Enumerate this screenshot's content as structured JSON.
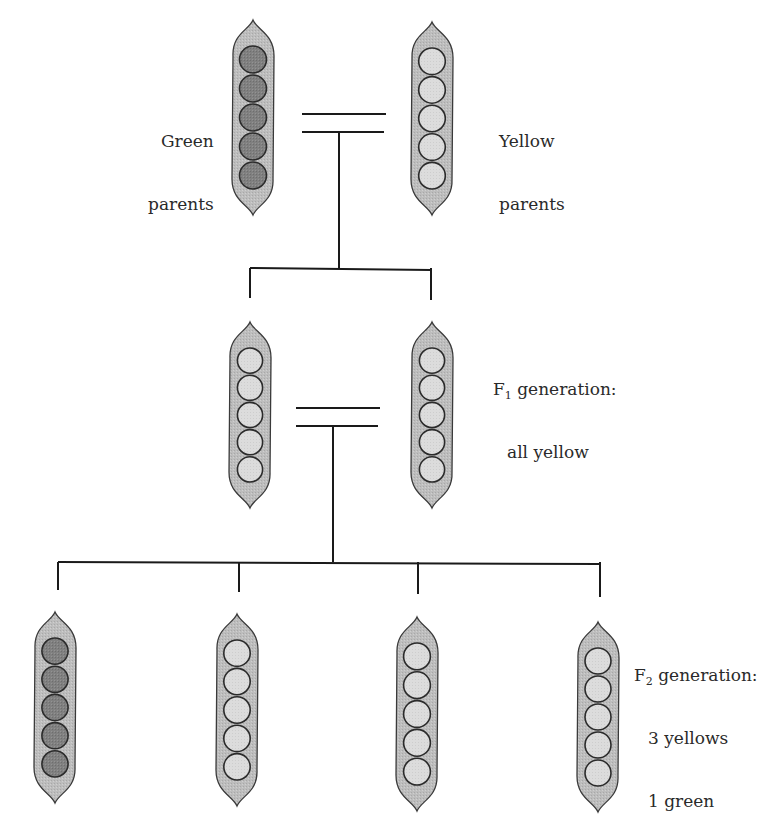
{
  "colors": {
    "background": "#ffffff",
    "line": "#1a1a1a",
    "pod_fill": "#bdbdbd",
    "pod_outline": "#3a3a3a",
    "pea_green": "#808080",
    "pea_yellow": "#dcdcdc",
    "pea_outline": "#2b2b2b",
    "text": "#2a2a2a"
  },
  "labels": {
    "green_parents": {
      "line1": "Green",
      "line2": "parents",
      "x": 148,
      "y": 89
    },
    "yellow_parents": {
      "line1": "Yellow",
      "line2": "parents",
      "x": 499,
      "y": 89
    },
    "f1": {
      "prefix": "F",
      "sub": "1",
      "line1_rest": " generation:",
      "line2": "all yellow",
      "x": 493,
      "y": 337
    },
    "f2": {
      "prefix": "F",
      "sub": "2",
      "line1_rest": " generation:",
      "line2": "3 yellows",
      "line3": "1 green",
      "x": 634,
      "y": 623
    }
  },
  "generations": [
    {
      "name": "parents",
      "pods": [
        {
          "id": "green-parent",
          "cx": 253,
          "top": 20,
          "bottom": 215,
          "pea": "green"
        },
        {
          "id": "yellow-parent",
          "cx": 432,
          "top": 22,
          "bottom": 215,
          "pea": "yellow"
        }
      ],
      "cross": {
        "x1": 302,
        "x2": 386,
        "y_top": 114,
        "y_bottom": 132
      }
    },
    {
      "name": "F1 generation",
      "pods": [
        {
          "id": "f1-pod-1",
          "cx": 250,
          "top": 322,
          "bottom": 508,
          "pea": "yellow"
        },
        {
          "id": "f1-pod-2",
          "cx": 432,
          "top": 322,
          "bottom": 508,
          "pea": "yellow"
        }
      ],
      "cross": {
        "x1": 296,
        "x2": 380,
        "y_top": 408,
        "y_bottom": 426
      }
    },
    {
      "name": "F2 generation",
      "pods": [
        {
          "id": "f2-pod-1",
          "cx": 55,
          "top": 612,
          "bottom": 803,
          "pea": "green"
        },
        {
          "id": "f2-pod-2",
          "cx": 237,
          "top": 614,
          "bottom": 806,
          "pea": "yellow"
        },
        {
          "id": "f2-pod-3",
          "cx": 417,
          "top": 617,
          "bottom": 811,
          "pea": "yellow"
        },
        {
          "id": "f2-pod-4",
          "cx": 598,
          "top": 622,
          "bottom": 812,
          "pea": "yellow"
        }
      ]
    }
  ],
  "connectors": [
    {
      "id": "parents-to-f1",
      "stem_x": 339,
      "stem_y1": 132,
      "stem_y2": 268,
      "bar_y": 268,
      "bar_x1": 250,
      "bar_x2": 431,
      "drops": [
        {
          "x": 250,
          "y2": 298
        },
        {
          "x": 431,
          "y2": 300
        }
      ]
    },
    {
      "id": "f1-to-f2",
      "stem_x": 333,
      "stem_y1": 426,
      "stem_y2": 562,
      "bar_y": 562,
      "bar_x1": 58,
      "bar_x2": 600,
      "drops": [
        {
          "x": 58,
          "y2": 590
        },
        {
          "x": 239,
          "y2": 592
        },
        {
          "x": 418,
          "y2": 594
        },
        {
          "x": 600,
          "y2": 597
        }
      ]
    }
  ],
  "peas_per_pod": 5
}
